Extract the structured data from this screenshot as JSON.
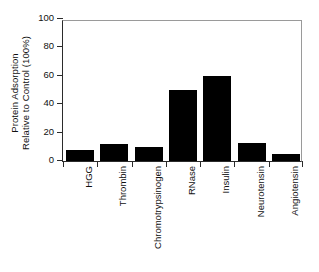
{
  "chart_data": {
    "type": "bar",
    "title": "",
    "xlabel": "",
    "ylabel_line1": "Protein Adsorption",
    "ylabel_line2": "Relative to Control (100%)",
    "categories": [
      "HGG",
      "Thrombin",
      "Chromotrypsinogen",
      "RNase",
      "Insulin",
      "Neurotensin",
      "Angiotensin"
    ],
    "values": [
      8,
      12,
      10,
      50,
      60,
      13,
      5
    ],
    "ylim": [
      0,
      100
    ],
    "yticks": [
      0,
      20,
      40,
      60,
      80,
      100
    ],
    "ytick_labels": [
      "0",
      "20",
      "40",
      "60",
      "80",
      "100"
    ],
    "grid": false,
    "legend": false,
    "bar_color": "#000000",
    "axis_color": "#2b2b2b",
    "frame_color": "#9a9a9a",
    "background": "#ffffff"
  }
}
